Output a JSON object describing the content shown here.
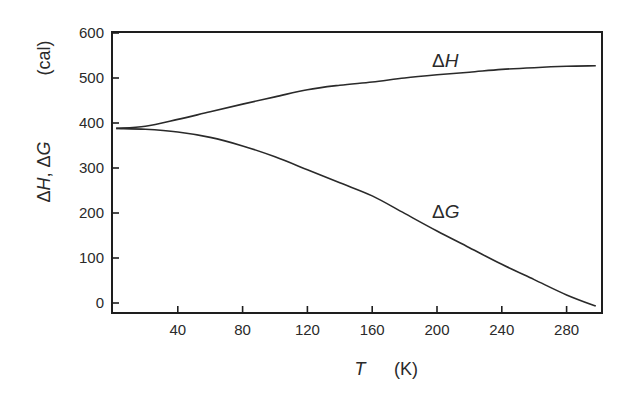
{
  "chart_data": {
    "type": "line",
    "title": "",
    "xlabel": "T (K)",
    "xlabel_symbol": "T",
    "xlabel_unit": "(K)",
    "ylabel": "ΔH, ΔG (cal)",
    "ylabel_symbols": "ΔH, ΔG",
    "ylabel_unit": "(cal)",
    "xlim": [
      0,
      302
    ],
    "ylim": [
      -22,
      600
    ],
    "xticks": [
      40,
      80,
      120,
      160,
      200,
      240,
      280
    ],
    "yticks": [
      0,
      100,
      200,
      300,
      400,
      500,
      600
    ],
    "grid": false,
    "legend": "inline labels",
    "x": [
      2,
      20,
      40,
      60,
      80,
      100,
      120,
      140,
      160,
      180,
      200,
      220,
      240,
      260,
      280,
      298
    ],
    "series": [
      {
        "name": "ΔH",
        "label_prefix": "Δ",
        "label_symbol": "H",
        "values": [
          388,
          393,
          408,
          425,
          442,
          458,
          474,
          484,
          491,
          500,
          507,
          513,
          519,
          523,
          526,
          527
        ]
      },
      {
        "name": "ΔG",
        "label_prefix": "Δ",
        "label_symbol": "G",
        "values": [
          388,
          386,
          380,
          368,
          349,
          325,
          296,
          267,
          238,
          199,
          160,
          123,
          86,
          52,
          18,
          -7
        ]
      }
    ],
    "annotations": [
      {
        "text": "ΔH",
        "x": 200,
        "y": 540
      },
      {
        "text": "ΔG",
        "x": 200,
        "y": 195
      }
    ]
  }
}
